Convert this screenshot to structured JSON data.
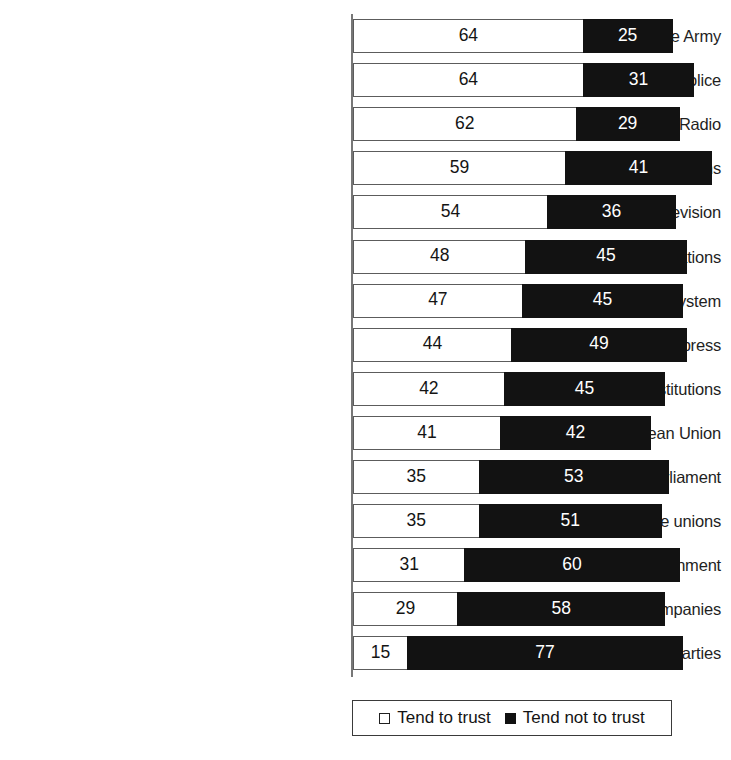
{
  "chart_data": {
    "type": "bar",
    "orientation": "horizontal",
    "stacked": true,
    "title": "",
    "subtitle": "",
    "xlabel": "",
    "ylabel": "",
    "xlim": [
      0,
      100
    ],
    "grid": false,
    "legend_position": "bottom",
    "categories": [
      "The Army",
      "The Police",
      "Radio",
      "Charitable or voluntary organisations",
      "Television",
      "The United Nations",
      "Justice/The national legal system",
      "The press",
      "The religiouos institutions",
      "The European Union",
      "The national parliament",
      "Trade unions",
      "The national government",
      "Big companies",
      "Political parties"
    ],
    "series": [
      {
        "name": "Tend to trust",
        "color": "#ffffff",
        "values": [
          64,
          64,
          62,
          59,
          54,
          48,
          47,
          44,
          42,
          41,
          35,
          35,
          31,
          29,
          15
        ]
      },
      {
        "name": "Tend not to trust",
        "color": "#111111",
        "values": [
          25,
          31,
          29,
          41,
          36,
          45,
          45,
          49,
          45,
          42,
          53,
          51,
          60,
          58,
          77
        ]
      }
    ],
    "rows": [
      {
        "label": "The Army",
        "trust": 64,
        "not_trust": 25
      },
      {
        "label": "The Police",
        "trust": 64,
        "not_trust": 31
      },
      {
        "label": "Radio",
        "trust": 62,
        "not_trust": 29
      },
      {
        "label": "Charitable or voluntary organisations",
        "trust": 59,
        "not_trust": 41
      },
      {
        "label": "Television",
        "trust": 54,
        "not_trust": 36
      },
      {
        "label": "The United Nations",
        "trust": 48,
        "not_trust": 45
      },
      {
        "label": "Justice/The national legal system",
        "trust": 47,
        "not_trust": 45
      },
      {
        "label": "The press",
        "trust": 44,
        "not_trust": 49
      },
      {
        "label": "The religiouos institutions",
        "trust": 42,
        "not_trust": 45
      },
      {
        "label": "The European Union",
        "trust": 41,
        "not_trust": 42
      },
      {
        "label": "The national parliament",
        "trust": 35,
        "not_trust": 53
      },
      {
        "label": "Trade unions",
        "trust": 35,
        "not_trust": 51
      },
      {
        "label": "The national government",
        "trust": 31,
        "not_trust": 60
      },
      {
        "label": "Big companies",
        "trust": 29,
        "not_trust": 58
      },
      {
        "label": "Political parties",
        "trust": 15,
        "not_trust": 77
      }
    ]
  },
  "legend": {
    "items": [
      {
        "label": "Tend to trust",
        "marker": "open-square-icon",
        "color": "#ffffff"
      },
      {
        "label": "Tend not to trust",
        "marker": "filled-square-icon",
        "color": "#111111"
      }
    ]
  }
}
